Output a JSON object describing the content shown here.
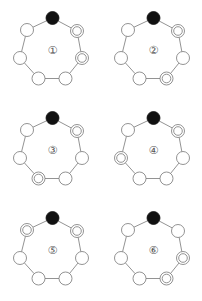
{
  "figure": {
    "node_positions": [
      {
        "x": 52.5,
        "y": 18
      },
      {
        "x": 77,
        "y": 31
      },
      {
        "x": 82,
        "y": 58
      },
      {
        "x": 65.5,
        "y": 78.5
      },
      {
        "x": 38.5,
        "y": 78.5
      },
      {
        "x": 20,
        "y": 58
      },
      {
        "x": 27,
        "y": 30
      }
    ],
    "panels": [
      {
        "label": "①",
        "number": 1,
        "origin": {
          "x": 0,
          "y": 0
        },
        "nodes": [
          "black",
          "double",
          "double",
          "plain",
          "plain",
          "plain",
          "plain"
        ]
      },
      {
        "label": "②",
        "number": 2,
        "origin": {
          "x": 101,
          "y": 0
        },
        "nodes": [
          "black",
          "double",
          "plain",
          "double",
          "plain",
          "plain",
          "plain"
        ]
      },
      {
        "label": "③",
        "number": 3,
        "origin": {
          "x": 0,
          "y": 100
        },
        "nodes": [
          "black",
          "double",
          "plain",
          "plain",
          "double",
          "plain",
          "plain"
        ]
      },
      {
        "label": "④",
        "number": 4,
        "origin": {
          "x": 101,
          "y": 100
        },
        "nodes": [
          "black",
          "double",
          "plain",
          "plain",
          "plain",
          "double",
          "plain"
        ]
      },
      {
        "label": "⑤",
        "number": 5,
        "origin": {
          "x": 0,
          "y": 200
        },
        "nodes": [
          "black",
          "double",
          "plain",
          "plain",
          "plain",
          "plain",
          "double"
        ]
      },
      {
        "label": "⑥",
        "number": 6,
        "origin": {
          "x": 101,
          "y": 200
        },
        "nodes": [
          "black",
          "plain",
          "double",
          "double",
          "plain",
          "plain",
          "plain"
        ]
      }
    ],
    "colors": {
      "stroke": "#777777",
      "fill_black": "#111111",
      "background": "#ffffff"
    }
  }
}
